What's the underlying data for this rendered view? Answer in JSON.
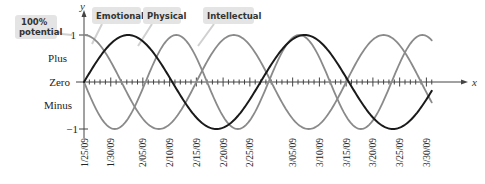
{
  "chart_data": {
    "type": "line",
    "title": "",
    "xlabel": "x",
    "ylabel": "y",
    "ylim": [
      -1,
      1
    ],
    "x_start_date": "1/25/09",
    "x_range_days": [
      0,
      65
    ],
    "x_tick_labels": [
      "1/25/09",
      "1/30/09",
      "2/05/09",
      "2/10/09",
      "2/15/09",
      "2/20/09",
      "2/25/09",
      "3/05/09",
      "3/10/09",
      "3/15/09",
      "3/20/09",
      "3/25/09",
      "3/30/09"
    ],
    "x_tick_days": [
      0,
      5,
      11,
      16,
      21,
      26,
      31,
      39,
      44,
      49,
      54,
      59,
      64
    ],
    "y_tick_labels": [
      {
        "value": 1,
        "label": "1"
      },
      {
        "value": 0.5,
        "label": "Plus"
      },
      {
        "value": 0,
        "label": "Zero"
      },
      {
        "value": -0.5,
        "label": "Minus"
      },
      {
        "value": -1,
        "label": "−1"
      }
    ],
    "series": [
      {
        "name": "Emotional",
        "period_days": 28,
        "phase": "cos",
        "color": "#8a8a8a",
        "description": "starts at 1 (100% potential) on 1/25/09"
      },
      {
        "name": "Physical",
        "period_days": 23,
        "phase": "neg-sin",
        "color": "#8a8a8a",
        "description": "starts at 0 descending on 1/25/09"
      },
      {
        "name": "Intellectual",
        "period_days": 33,
        "phase": "sin",
        "color": "#1a1a1a",
        "description": "starts at 0 ascending on 1/25/09"
      }
    ],
    "annotations": [
      {
        "text": "100% potential",
        "points_to": "y = 1"
      },
      {
        "text": "Emotional"
      },
      {
        "text": "Physical"
      },
      {
        "text": "Intellectual"
      }
    ],
    "grid": false,
    "legend_position": "top callouts"
  },
  "labels": {
    "callout_potential_line1": "100%",
    "callout_potential_line2": "potential",
    "emotional": "Emotional",
    "physical": "Physical",
    "intellectual": "Intellectual",
    "y_axis": "y",
    "x_axis": "x",
    "y_one": "1",
    "y_plus": "Plus",
    "y_zero": "Zero",
    "y_minus": "Minus",
    "y_neg_one": "−1"
  },
  "colors": {
    "callout_bg": "#e4e4e4",
    "gray_curve": "#8a8a8a",
    "dark_curve": "#1a1a1a",
    "axis": "#444444"
  }
}
